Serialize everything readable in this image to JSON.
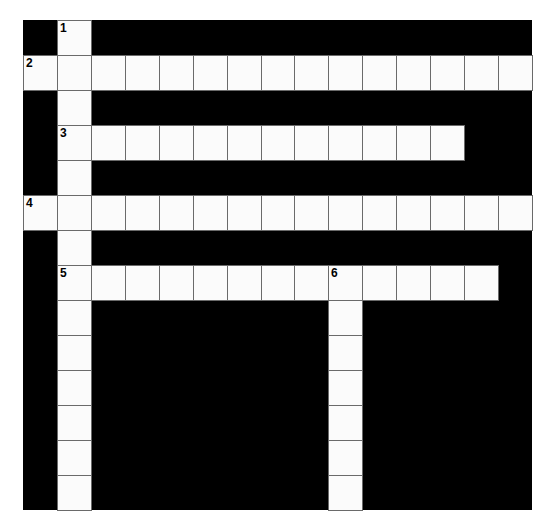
{
  "puzzle": {
    "rows": 14,
    "cols": 15,
    "cell_width": 33.93,
    "cell_height": 35,
    "block_color": "#000000",
    "cell_color": "#fbfbfb",
    "line_color": "#6a6a6a",
    "entries": [
      {
        "number": "1",
        "direction": "down",
        "row": 0,
        "col": 1,
        "length": 14
      },
      {
        "number": "2",
        "direction": "across",
        "row": 1,
        "col": 0,
        "length": 15
      },
      {
        "number": "3",
        "direction": "across",
        "row": 3,
        "col": 1,
        "length": 12
      },
      {
        "number": "4",
        "direction": "across",
        "row": 5,
        "col": 0,
        "length": 15
      },
      {
        "number": "5",
        "direction": "across",
        "row": 7,
        "col": 1,
        "length": 13
      },
      {
        "number": "6",
        "direction": "down",
        "row": 7,
        "col": 9,
        "length": 7
      }
    ]
  }
}
